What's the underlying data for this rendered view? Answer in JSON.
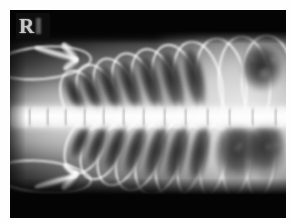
{
  "image": {
    "modality": "radiograph",
    "view_label": "ventrodorsal thoracic radiograph",
    "background_color": "#050505",
    "border_color": "#ffffff",
    "bone_color": "#ffffff",
    "soft_tissue_color": "#d2d2d2",
    "lung_lucency_color": "#1a1a1a"
  },
  "marker": {
    "letter": "R",
    "name": "laterality-marker",
    "description": "right-side lead marker"
  },
  "anatomy": {
    "spine": {
      "label": "vertebral column",
      "vertebrae": [
        {
          "x": 2,
          "width": 17
        },
        {
          "x": 21,
          "width": 16
        },
        {
          "x": 39,
          "width": 16
        },
        {
          "x": 57,
          "width": 17
        },
        {
          "x": 76,
          "width": 17
        },
        {
          "x": 95,
          "width": 18
        },
        {
          "x": 115,
          "width": 18
        },
        {
          "x": 135,
          "width": 19
        },
        {
          "x": 156,
          "width": 19
        },
        {
          "x": 177,
          "width": 20
        },
        {
          "x": 199,
          "width": 20
        },
        {
          "x": 221,
          "width": 21
        },
        {
          "x": 244,
          "width": 21
        },
        {
          "x": 267,
          "width": 14
        }
      ]
    },
    "ribs_dorsal": [
      {
        "left": 52,
        "top": 58,
        "width": 34,
        "height": 60,
        "rotate": -24
      },
      {
        "left": 68,
        "top": 52,
        "width": 36,
        "height": 66,
        "rotate": -22
      },
      {
        "left": 85,
        "top": 46,
        "width": 38,
        "height": 72,
        "rotate": -20
      },
      {
        "left": 103,
        "top": 41,
        "width": 40,
        "height": 76,
        "rotate": -18
      },
      {
        "left": 122,
        "top": 37,
        "width": 42,
        "height": 80,
        "rotate": -16
      },
      {
        "left": 142,
        "top": 33,
        "width": 44,
        "height": 84,
        "rotate": -14
      },
      {
        "left": 163,
        "top": 30,
        "width": 46,
        "height": 87,
        "rotate": -11
      },
      {
        "left": 185,
        "top": 27,
        "width": 48,
        "height": 90,
        "rotate": -8
      },
      {
        "left": 208,
        "top": 25,
        "width": 49,
        "height": 92,
        "rotate": -5
      },
      {
        "left": 231,
        "top": 24,
        "width": 50,
        "height": 93,
        "rotate": -2
      }
    ],
    "ribs_ventral": [
      {
        "left": 56,
        "top": 104,
        "width": 34,
        "height": 58,
        "rotate": 24
      },
      {
        "left": 72,
        "top": 104,
        "width": 36,
        "height": 64,
        "rotate": 22
      },
      {
        "left": 89,
        "top": 104,
        "width": 38,
        "height": 70,
        "rotate": 20
      },
      {
        "left": 107,
        "top": 104,
        "width": 40,
        "height": 75,
        "rotate": 18
      },
      {
        "left": 126,
        "top": 104,
        "width": 42,
        "height": 79,
        "rotate": 16
      },
      {
        "left": 146,
        "top": 104,
        "width": 44,
        "height": 83,
        "rotate": 14
      },
      {
        "left": 167,
        "top": 104,
        "width": 46,
        "height": 86,
        "rotate": 11
      },
      {
        "left": 189,
        "top": 104,
        "width": 48,
        "height": 89,
        "rotate": 8
      },
      {
        "left": 212,
        "top": 104,
        "width": 49,
        "height": 91,
        "rotate": 5
      },
      {
        "left": 235,
        "top": 104,
        "width": 50,
        "height": 92,
        "rotate": 2
      }
    ],
    "lung_lucencies_dorsal": [
      {
        "left": 58,
        "top": 66,
        "width": 15,
        "height": 40,
        "rotate": -24
      },
      {
        "left": 75,
        "top": 60,
        "width": 16,
        "height": 46,
        "rotate": -22
      },
      {
        "left": 93,
        "top": 54,
        "width": 17,
        "height": 52,
        "rotate": -20
      },
      {
        "left": 112,
        "top": 49,
        "width": 18,
        "height": 56,
        "rotate": -18
      },
      {
        "left": 132,
        "top": 45,
        "width": 19,
        "height": 59,
        "rotate": -16
      },
      {
        "left": 153,
        "top": 41,
        "width": 20,
        "height": 62,
        "rotate": -14
      },
      {
        "left": 175,
        "top": 38,
        "width": 20,
        "height": 63,
        "rotate": -11
      }
    ],
    "lung_lucencies_ventral": [
      {
        "left": 62,
        "top": 114,
        "width": 15,
        "height": 38,
        "rotate": 24
      },
      {
        "left": 79,
        "top": 114,
        "width": 16,
        "height": 44,
        "rotate": 22
      },
      {
        "left": 97,
        "top": 114,
        "width": 17,
        "height": 50,
        "rotate": 20
      },
      {
        "left": 116,
        "top": 114,
        "width": 18,
        "height": 54,
        "rotate": 18
      },
      {
        "left": 136,
        "top": 114,
        "width": 19,
        "height": 58,
        "rotate": 16
      },
      {
        "left": 157,
        "top": 114,
        "width": 20,
        "height": 61,
        "rotate": 14
      },
      {
        "left": 179,
        "top": 114,
        "width": 20,
        "height": 62,
        "rotate": 11
      }
    ],
    "gas_pockets": [
      {
        "left": 205,
        "top": 112,
        "width": 46,
        "height": 62,
        "rotate": 4,
        "label": "caudal gas lucency"
      },
      {
        "left": 236,
        "top": 110,
        "width": 40,
        "height": 60,
        "rotate": 2,
        "label": "caudal gas lucency lateral"
      },
      {
        "left": 232,
        "top": 36,
        "width": 40,
        "height": 46,
        "rotate": -4,
        "label": "dorsal caudal lucency"
      }
    ],
    "forelimbs": [
      {
        "label": "cranial forelimb",
        "position": "upper-left"
      },
      {
        "label": "caudal forelimb",
        "position": "lower-left"
      }
    ]
  }
}
